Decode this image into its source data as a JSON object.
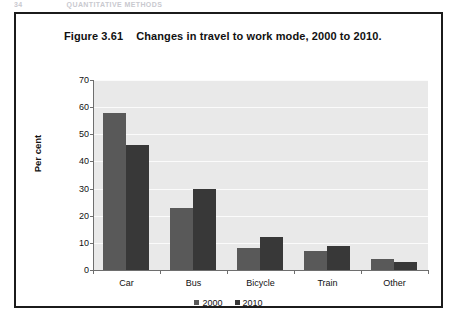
{
  "page_header": {
    "folio": "34",
    "running_head": "QUANTITATIVE METHODS"
  },
  "figure": {
    "label": "Figure 3.61",
    "caption": "Changes in travel to work mode, 2000 to 2010."
  },
  "colors": {
    "series_2000": "#595959",
    "series_2010": "#383838",
    "plot_background": "#e9e9e9",
    "gridline": "#fbfbfb",
    "axis": "#6e6e6e",
    "frame": "#1b1b1b"
  },
  "chart_data": {
    "type": "bar",
    "xlabel": "",
    "ylabel": "Per cent",
    "categories": [
      "Car",
      "Bus",
      "Bicycle",
      "Train",
      "Other"
    ],
    "series": [
      {
        "name": "2000",
        "color": "#595959",
        "values": [
          58,
          23,
          8,
          7,
          4
        ]
      },
      {
        "name": "2010",
        "color": "#383838",
        "values": [
          46,
          30,
          12,
          9,
          3
        ]
      }
    ],
    "ylim": [
      0,
      70
    ],
    "ytick_step": 10,
    "yticks": [
      0,
      10,
      20,
      30,
      40,
      50,
      60,
      70
    ],
    "ytick_labels": [
      "0",
      "10",
      "20",
      "30",
      "40",
      "50",
      "60",
      "70"
    ],
    "grid": "horizontal",
    "legend_position": "bottom",
    "legend": [
      "2000",
      "2010"
    ]
  }
}
